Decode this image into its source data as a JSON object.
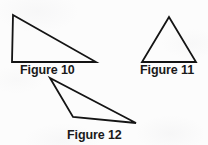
{
  "document": {
    "type": "geometry-worksheet-figure",
    "background_color": "#fcfcfc",
    "stroke_color": "#141414",
    "text_color": "#1a1a1a",
    "width": 208,
    "height": 145
  },
  "figures": [
    {
      "id": "figure-10",
      "label": "Figure 10",
      "shape": "triangle",
      "description": "right triangle",
      "points": "13,15 12,62 96,62",
      "stroke_width": 1.8,
      "label_x": 20,
      "label_y": 64
    },
    {
      "id": "figure-11",
      "label": "Figure 11",
      "shape": "triangle",
      "description": "isosceles triangle",
      "points": "169,17 142,62 196,62",
      "stroke_width": 1.8,
      "label_x": 140,
      "label_y": 64
    },
    {
      "id": "figure-12",
      "label": "Figure 12",
      "shape": "triangle",
      "description": "obtuse scalene triangle",
      "points": "50,78 73,117 136,123",
      "stroke_width": 1.8,
      "label_x": 67,
      "label_y": 129
    }
  ]
}
